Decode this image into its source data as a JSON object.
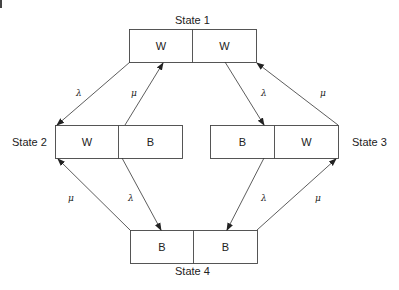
{
  "diagram": {
    "type": "state-transition",
    "states": [
      {
        "id": "state1",
        "label": "State 1",
        "cells": [
          "W",
          "W"
        ]
      },
      {
        "id": "state2",
        "label": "State 2",
        "cells": [
          "W",
          "B"
        ]
      },
      {
        "id": "state3",
        "label": "State 3",
        "cells": [
          "B",
          "W"
        ]
      },
      {
        "id": "state4",
        "label": "State 4",
        "cells": [
          "B",
          "B"
        ]
      }
    ],
    "transitions": [
      {
        "from": "state1",
        "to": "state2",
        "rate": "λ"
      },
      {
        "from": "state2",
        "to": "state1",
        "rate": "μ"
      },
      {
        "from": "state1",
        "to": "state3",
        "rate": "λ"
      },
      {
        "from": "state3",
        "to": "state1",
        "rate": "μ"
      },
      {
        "from": "state2",
        "to": "state4",
        "rate": "λ"
      },
      {
        "from": "state4",
        "to": "state2",
        "rate": "μ"
      },
      {
        "from": "state3",
        "to": "state4",
        "rate": "λ"
      },
      {
        "from": "state4",
        "to": "state3",
        "rate": "μ"
      }
    ]
  }
}
